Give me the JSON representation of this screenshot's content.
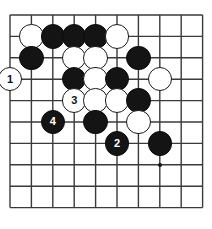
{
  "diagram": {
    "kind": "go-board-diagram",
    "width": 212,
    "height": 229,
    "colors": {
      "background": "#ffffff",
      "grid_line": "#3a3a3a",
      "black_stone": "#141414",
      "white_stone": "#ffffff",
      "stone_outline": "#1a1a1a",
      "black_label_text": "#ffffff",
      "white_label_text": "#111111"
    },
    "grid": {
      "columns": 10,
      "rows": 10,
      "spacing": 21.4,
      "origin_x": 10,
      "origin_y": 15,
      "line_width": 1.4,
      "visible": true
    },
    "star_points": [
      {
        "col": 7,
        "row": 7
      }
    ],
    "stone_radius": 12.2,
    "stones": [
      {
        "col": 1,
        "row": 1,
        "color": "white",
        "label": ""
      },
      {
        "col": 2,
        "row": 1,
        "color": "black",
        "label": ""
      },
      {
        "col": 3,
        "row": 1,
        "color": "black",
        "label": ""
      },
      {
        "col": 4,
        "row": 1,
        "color": "black",
        "label": ""
      },
      {
        "col": 5,
        "row": 1,
        "color": "white",
        "label": ""
      },
      {
        "col": 1,
        "row": 2,
        "color": "black",
        "label": ""
      },
      {
        "col": 3,
        "row": 2,
        "color": "white",
        "label": ""
      },
      {
        "col": 4,
        "row": 2,
        "color": "white",
        "label": ""
      },
      {
        "col": 6,
        "row": 2,
        "color": "black",
        "label": ""
      },
      {
        "col": 0,
        "row": 3,
        "color": "white",
        "label": "1"
      },
      {
        "col": 3,
        "row": 3,
        "color": "black",
        "label": ""
      },
      {
        "col": 4,
        "row": 3,
        "color": "white",
        "label": ""
      },
      {
        "col": 5,
        "row": 3,
        "color": "black",
        "label": ""
      },
      {
        "col": 7,
        "row": 3,
        "color": "white",
        "label": ""
      },
      {
        "col": 3,
        "row": 4,
        "color": "white",
        "label": "3"
      },
      {
        "col": 4,
        "row": 4,
        "color": "white",
        "label": ""
      },
      {
        "col": 5,
        "row": 4,
        "color": "white",
        "label": ""
      },
      {
        "col": 6,
        "row": 4,
        "color": "black",
        "label": ""
      },
      {
        "col": 2,
        "row": 5,
        "color": "black",
        "label": "4"
      },
      {
        "col": 4,
        "row": 5,
        "color": "black",
        "label": ""
      },
      {
        "col": 6,
        "row": 5,
        "color": "white",
        "label": ""
      },
      {
        "col": 5,
        "row": 6,
        "color": "black",
        "label": "2"
      },
      {
        "col": 7,
        "row": 6,
        "color": "black",
        "label": ""
      }
    ],
    "move_sequence": [
      {
        "number": "1",
        "color": "white"
      },
      {
        "number": "2",
        "color": "black"
      },
      {
        "number": "3",
        "color": "white"
      },
      {
        "number": "4",
        "color": "black"
      }
    ]
  }
}
